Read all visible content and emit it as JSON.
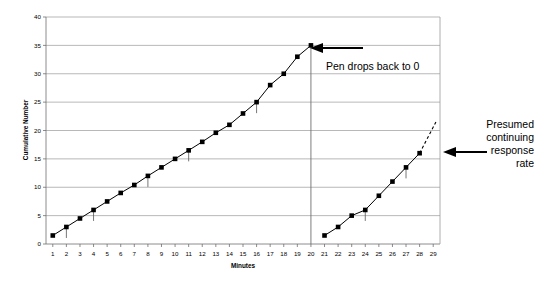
{
  "chart_data": {
    "type": "line",
    "title": "",
    "xlabel": "Minutes",
    "ylabel": "Cumulative Number",
    "xlim": [
      0.5,
      29.5
    ],
    "ylim": [
      0,
      40
    ],
    "yticks": [
      0,
      5,
      10,
      15,
      20,
      25,
      30,
      35,
      40
    ],
    "xticks": [
      1,
      2,
      3,
      4,
      5,
      6,
      7,
      8,
      9,
      10,
      11,
      12,
      13,
      14,
      15,
      16,
      17,
      18,
      19,
      20,
      21,
      22,
      23,
      24,
      25,
      26,
      27,
      28,
      29
    ],
    "grid": true,
    "legend": "none",
    "series": [
      {
        "name": "Session 1 cumulative record",
        "x": [
          1,
          2,
          3,
          4,
          5,
          6,
          7,
          8,
          9,
          10,
          11,
          12,
          13,
          14,
          15,
          16,
          17,
          18,
          19,
          20
        ],
        "values": [
          1.5,
          3.0,
          4.5,
          6.0,
          7.5,
          9.0,
          10.4,
          12.0,
          13.5,
          15.0,
          16.5,
          18.0,
          19.6,
          21.0,
          23.0,
          25.0,
          28.0,
          30.0,
          33.0,
          35.0
        ]
      },
      {
        "name": "Session 2 cumulative record",
        "x": [
          21,
          22,
          23,
          24,
          25,
          26,
          27,
          28
        ],
        "values": [
          1.5,
          3.0,
          5.0,
          6.0,
          8.5,
          11.0,
          13.5,
          16.0
        ]
      }
    ],
    "reset_line": {
      "name": "pen reset at minute 20",
      "x": 20,
      "from_y": 35,
      "to_y": 0
    },
    "extrapolation": {
      "name": "Presumed continuing response rate",
      "style": "dashed",
      "x": [
        28,
        29.2
      ],
      "values": [
        16.0,
        21.5
      ]
    },
    "reinforcement_marks": {
      "label": "reinforcement hash marks",
      "x": [
        2,
        4,
        8,
        11,
        16,
        24,
        27
      ]
    }
  },
  "annotations": {
    "pen_drop": {
      "text": "Pen drops back to 0",
      "arrow": "left-arrow"
    },
    "presumed_rate": {
      "lines": [
        "Presumed",
        "continuing",
        "response",
        "rate"
      ],
      "line1": "Presumed",
      "line2": "continuing",
      "line3": "response",
      "line4": "rate",
      "arrow": "left-arrow"
    }
  },
  "axis_labels": {
    "y_title": "Cumulative Number",
    "x_title": "Minutes",
    "y_ticks": [
      "0",
      "5",
      "10",
      "15",
      "20",
      "25",
      "30",
      "35",
      "40"
    ],
    "x_ticks": [
      "1",
      "2",
      "3",
      "4",
      "5",
      "6",
      "7",
      "8",
      "9",
      "10",
      "11",
      "12",
      "13",
      "14",
      "15",
      "16",
      "17",
      "18",
      "19",
      "20",
      "21",
      "22",
      "23",
      "24",
      "25",
      "26",
      "27",
      "28",
      "29"
    ]
  },
  "colors": {
    "line": "#000000",
    "grid": "#9a9a9a",
    "background": "#ffffff"
  }
}
